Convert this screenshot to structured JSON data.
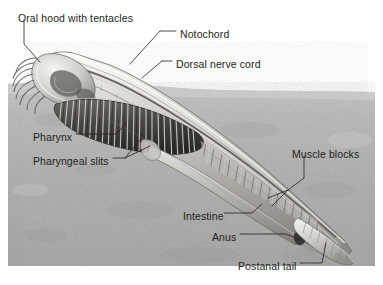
{
  "figure": {
    "background_color": "#ffffff",
    "substrate_color": "#b3b3b3",
    "label_color": "#231f20",
    "width": 383,
    "height": 285
  },
  "labels": [
    {
      "id": "oral-hood-with-tentacles",
      "text": "Oral hood with tentacles",
      "x": 18,
      "y": 12,
      "leader": "vertical-then-diagonal-down-right"
    },
    {
      "id": "notochord",
      "text": "Notochord",
      "x": 180,
      "y": 28,
      "leader": "dash-left-then-diagonal-down-left"
    },
    {
      "id": "dorsal-nerve-cord",
      "text": "Dorsal nerve cord",
      "x": 176,
      "y": 58,
      "leader": "dash-left-then-diagonal-down-left"
    },
    {
      "id": "pharynx",
      "text": "Pharynx",
      "x": 33,
      "y": 131,
      "leader": "dash-right"
    },
    {
      "id": "pharyngeal-slits",
      "text": "Pharyngeal slits",
      "x": 33,
      "y": 155,
      "leader": "dash-right-forking-up"
    },
    {
      "id": "muscle-blocks",
      "text": "Muscle blocks",
      "x": 292,
      "y": 148,
      "leader": "vertical-down-then-fork-left"
    },
    {
      "id": "intestine",
      "text": "Intestine",
      "x": 183,
      "y": 210,
      "leader": "dash-right-up"
    },
    {
      "id": "anus",
      "text": "Anus",
      "x": 212,
      "y": 231,
      "leader": "dash-right-up"
    },
    {
      "id": "postanal-tail",
      "text": "Postanal tail",
      "x": 238,
      "y": 260,
      "leader": "dash-right-up"
    }
  ],
  "anatomy_parts": [
    {
      "id": "oral-hood",
      "name": "Oral hood"
    },
    {
      "id": "tentacles",
      "name": "Tentacles (buccal cirri)"
    },
    {
      "id": "notochord",
      "name": "Notochord"
    },
    {
      "id": "dorsal-nerve-cord",
      "name": "Dorsal nerve cord"
    },
    {
      "id": "pharynx",
      "name": "Pharynx"
    },
    {
      "id": "pharyngeal-slits",
      "name": "Pharyngeal slits"
    },
    {
      "id": "muscle-blocks",
      "name": "Muscle blocks (myomeres)"
    },
    {
      "id": "intestine",
      "name": "Intestine"
    },
    {
      "id": "anus",
      "name": "Anus"
    },
    {
      "id": "postanal-tail",
      "name": "Postanal tail"
    },
    {
      "id": "substrate",
      "name": "Sandy substrate"
    }
  ]
}
